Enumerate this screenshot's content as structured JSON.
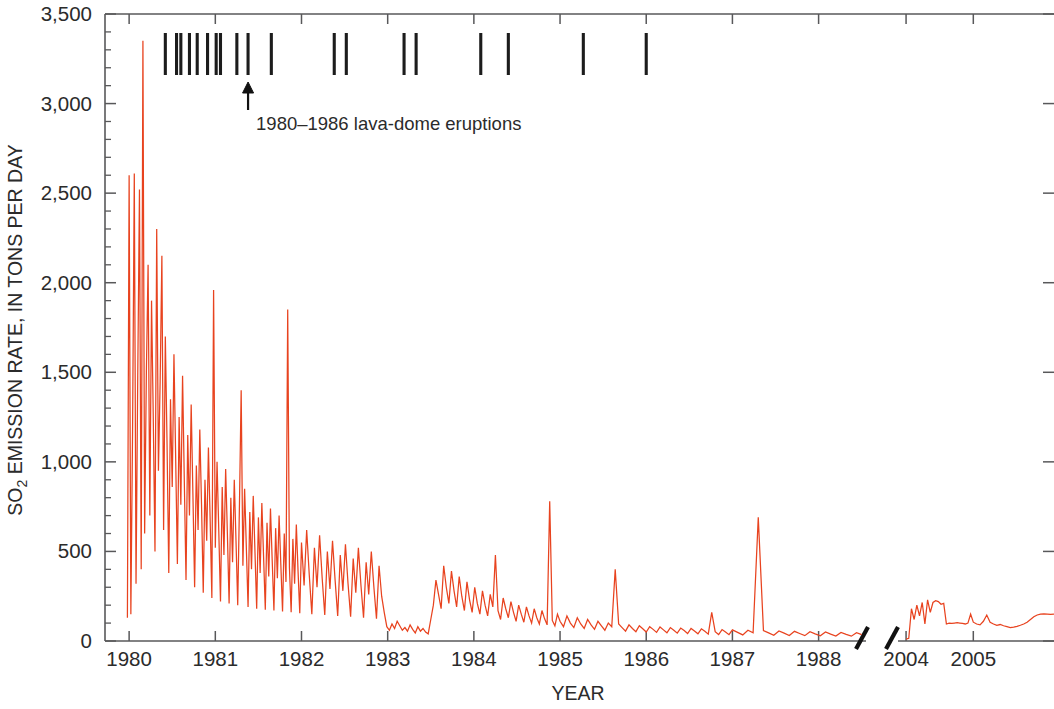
{
  "chart_data": {
    "type": "line",
    "title": "",
    "xlabel": "YEAR",
    "ylabel": "SO2 EMISSION RATE, IN TONS PER DAY",
    "ylabel_main": "SO",
    "ylabel_sub": "2",
    "ylabel_rest": " EMISSION RATE, IN TONS PER DAY",
    "ylim": [
      0,
      3500
    ],
    "ytick_values": [
      0,
      500,
      1000,
      1500,
      2000,
      2500,
      3000,
      3500
    ],
    "ytick_labels": [
      "0",
      "500",
      "1,000",
      "1,500",
      "2,000",
      "2,500",
      "3,000",
      "3,500"
    ],
    "yminor_step": 100,
    "grid": false,
    "legend_position": "none",
    "line_color": "#e8431f",
    "axis_color": "#58585a",
    "event_color": "#1c1c1c",
    "axis_break": true,
    "axis_break_note": "time axis broken between 1988.5 and 2004.0",
    "segments": [
      {
        "name": "1980-1988",
        "xtick_values": [
          1980,
          1981,
          1982,
          1983,
          1984,
          1985,
          1986,
          1987,
          1988
        ],
        "xtick_labels": [
          "1980",
          "1981",
          "1982",
          "1983",
          "1984",
          "1985",
          "1986",
          "1987",
          "1988"
        ],
        "xlim": [
          1979.72,
          1988.55
        ],
        "x": [
          1979.98,
          1980.0,
          1980.02,
          1980.04,
          1980.06,
          1980.08,
          1980.1,
          1980.12,
          1980.14,
          1980.16,
          1980.18,
          1980.2,
          1980.22,
          1980.24,
          1980.26,
          1980.28,
          1980.3,
          1980.32,
          1980.34,
          1980.36,
          1980.38,
          1980.4,
          1980.42,
          1980.44,
          1980.46,
          1980.48,
          1980.5,
          1980.52,
          1980.54,
          1980.56,
          1980.58,
          1980.6,
          1980.62,
          1980.64,
          1980.66,
          1980.68,
          1980.7,
          1980.72,
          1980.74,
          1980.76,
          1980.78,
          1980.8,
          1980.82,
          1980.84,
          1980.86,
          1980.88,
          1980.9,
          1980.92,
          1980.94,
          1980.96,
          1980.98,
          1981.0,
          1981.02,
          1981.04,
          1981.06,
          1981.08,
          1981.1,
          1981.12,
          1981.14,
          1981.16,
          1981.18,
          1981.2,
          1981.22,
          1981.24,
          1981.26,
          1981.28,
          1981.3,
          1981.32,
          1981.34,
          1981.36,
          1981.38,
          1981.4,
          1981.42,
          1981.44,
          1981.46,
          1981.48,
          1981.5,
          1981.52,
          1981.54,
          1981.56,
          1981.58,
          1981.6,
          1981.62,
          1981.64,
          1981.66,
          1981.68,
          1981.7,
          1981.72,
          1981.74,
          1981.76,
          1981.78,
          1981.8,
          1981.82,
          1981.84,
          1981.86,
          1981.88,
          1981.9,
          1981.92,
          1981.94,
          1981.96,
          1981.98,
          1982.0,
          1982.03,
          1982.06,
          1982.09,
          1982.12,
          1982.15,
          1982.18,
          1982.21,
          1982.24,
          1982.27,
          1982.3,
          1982.33,
          1982.36,
          1982.39,
          1982.42,
          1982.45,
          1982.48,
          1982.51,
          1982.54,
          1982.57,
          1982.6,
          1982.63,
          1982.66,
          1982.69,
          1982.72,
          1982.75,
          1982.78,
          1982.81,
          1982.84,
          1982.87,
          1982.9,
          1982.93,
          1982.96,
          1982.99,
          1983.02,
          1983.05,
          1983.08,
          1983.11,
          1983.14,
          1983.17,
          1983.2,
          1983.23,
          1983.26,
          1983.29,
          1983.32,
          1983.35,
          1983.38,
          1983.41,
          1983.44,
          1983.47,
          1983.5,
          1983.53,
          1983.56,
          1983.59,
          1983.62,
          1983.65,
          1983.68,
          1983.71,
          1983.74,
          1983.77,
          1983.8,
          1983.83,
          1983.86,
          1983.89,
          1983.92,
          1983.95,
          1983.98,
          1984.01,
          1984.04,
          1984.07,
          1984.1,
          1984.13,
          1984.16,
          1984.19,
          1984.22,
          1984.25,
          1984.28,
          1984.31,
          1984.34,
          1984.37,
          1984.4,
          1984.43,
          1984.46,
          1984.49,
          1984.52,
          1984.55,
          1984.58,
          1984.61,
          1984.64,
          1984.67,
          1984.7,
          1984.73,
          1984.76,
          1984.79,
          1984.82,
          1984.85,
          1984.88,
          1984.91,
          1984.94,
          1984.97,
          1985.0,
          1985.04,
          1985.08,
          1985.12,
          1985.16,
          1985.2,
          1985.24,
          1985.28,
          1985.32,
          1985.36,
          1985.4,
          1985.44,
          1985.48,
          1985.52,
          1985.56,
          1985.6,
          1985.64,
          1985.68,
          1985.72,
          1985.76,
          1985.8,
          1985.84,
          1985.88,
          1985.92,
          1985.96,
          1986.0,
          1986.04,
          1986.08,
          1986.12,
          1986.16,
          1986.2,
          1986.24,
          1986.28,
          1986.32,
          1986.36,
          1986.4,
          1986.44,
          1986.48,
          1986.52,
          1986.56,
          1986.6,
          1986.64,
          1986.68,
          1986.72,
          1986.76,
          1986.8,
          1986.84,
          1986.88,
          1986.92,
          1986.96,
          1987.0,
          1987.06,
          1987.12,
          1987.18,
          1987.24,
          1987.3,
          1987.36,
          1987.42,
          1987.48,
          1987.54,
          1987.6,
          1987.66,
          1987.72,
          1987.78,
          1987.84,
          1987.9,
          1987.96,
          1988.02,
          1988.08,
          1988.14,
          1988.2,
          1988.26,
          1988.32,
          1988.38,
          1988.44,
          1988.5
        ],
        "y": [
          130,
          2600,
          150,
          1180,
          2610,
          320,
          1480,
          2520,
          400,
          3350,
          600,
          1500,
          2100,
          700,
          1900,
          1250,
          500,
          2300,
          950,
          1450,
          2150,
          620,
          1700,
          1100,
          380,
          1350,
          860,
          1600,
          1020,
          430,
          1250,
          760,
          1480,
          900,
          340,
          1150,
          700,
          1320,
          820,
          300,
          980,
          620,
          1180,
          760,
          270,
          900,
          560,
          1080,
          680,
          240,
          1960,
          520,
          1000,
          620,
          220,
          860,
          480,
          960,
          600,
          210,
          800,
          440,
          900,
          560,
          200,
          760,
          1400,
          420,
          850,
          520,
          190,
          720,
          400,
          810,
          500,
          180,
          690,
          380,
          770,
          470,
          175,
          660,
          360,
          740,
          450,
          170,
          630,
          350,
          700,
          430,
          165,
          600,
          330,
          1850,
          410,
          160,
          570,
          320,
          650,
          390,
          155,
          550,
          310,
          620,
          370,
          150,
          520,
          300,
          590,
          350,
          145,
          500,
          290,
          560,
          340,
          140,
          480,
          280,
          540,
          320,
          135,
          460,
          270,
          520,
          310,
          130,
          440,
          260,
          500,
          300,
          125,
          420,
          250,
          160,
          80,
          60,
          95,
          70,
          110,
          85,
          60,
          75,
          55,
          90,
          65,
          45,
          80,
          55,
          70,
          50,
          40,
          120,
          200,
          340,
          260,
          180,
          420,
          300,
          210,
          390,
          280,
          190,
          360,
          250,
          170,
          330,
          230,
          160,
          300,
          210,
          150,
          280,
          200,
          140,
          260,
          190,
          480,
          170,
          120,
          240,
          180,
          130,
          220,
          160,
          110,
          200,
          150,
          105,
          190,
          140,
          100,
          180,
          130,
          95,
          170,
          125,
          90,
          780,
          115,
          85,
          150,
          110,
          80,
          140,
          100,
          75,
          130,
          95,
          70,
          120,
          90,
          65,
          110,
          85,
          60,
          100,
          80,
          400,
          95,
          75,
          55,
          90,
          70,
          52,
          85,
          68,
          50,
          80,
          65,
          48,
          78,
          62,
          46,
          75,
          60,
          44,
          72,
          58,
          42,
          70,
          56,
          40,
          68,
          54,
          38,
          160,
          52,
          36,
          64,
          50,
          35,
          62,
          48,
          34,
          60,
          46,
          690,
          58,
          45,
          32,
          56,
          44,
          31,
          54,
          42,
          30,
          52,
          40,
          29,
          50,
          38,
          28,
          48,
          37,
          27,
          46,
          36,
          26,
          45,
          35,
          670,
          44,
          34,
          25,
          43,
          33,
          24,
          42,
          32,
          23,
          41,
          31,
          22,
          40,
          30,
          21,
          39,
          29,
          20,
          38,
          28,
          19,
          37,
          27,
          18,
          36,
          26,
          30,
          25,
          35,
          28,
          22,
          32,
          26,
          20,
          30,
          24,
          18,
          28,
          22,
          17,
          26,
          21,
          16,
          25,
          20,
          15,
          24,
          19,
          14,
          23,
          18,
          13,
          22,
          17
        ]
      },
      {
        "name": "2004-2006",
        "xtick_values": [
          2004,
          2005
        ],
        "xtick_labels": [
          "2004",
          "2005"
        ],
        "xlim": [
          2003.88,
          2006.2
        ],
        "x": [
          2004.0,
          2004.04,
          2004.08,
          2004.12,
          2004.16,
          2004.2,
          2004.24,
          2004.28,
          2004.32,
          2004.36,
          2004.4,
          2004.44,
          2004.48,
          2004.52,
          2004.56,
          2004.6,
          2004.64,
          2004.68,
          2004.72,
          2004.76,
          2004.8,
          2004.84,
          2004.88,
          2004.92,
          2004.96,
          2005.0,
          2005.05,
          2005.1,
          2005.15,
          2005.2,
          2005.25,
          2005.3,
          2005.35,
          2005.4,
          2005.45,
          2005.5,
          2005.55,
          2005.6,
          2005.65,
          2005.7,
          2005.75,
          2005.8,
          2005.85,
          2005.9,
          2005.95,
          2006.0,
          2006.05,
          2006.1,
          2006.15,
          2006.2
        ],
        "y": [
          10,
          15,
          180,
          120,
          200,
          140,
          215,
          95,
          230,
          160,
          215,
          225,
          220,
          205,
          210,
          95,
          100,
          98,
          100,
          102,
          100,
          98,
          95,
          100,
          150,
          105,
          95,
          90,
          110,
          145,
          105,
          95,
          88,
          92,
          85,
          80,
          75,
          78,
          82,
          88,
          95,
          105,
          120,
          135,
          145,
          150,
          152,
          150,
          148,
          150
        ]
      }
    ],
    "events": {
      "label": "1980–1986 lava-dome eruptions",
      "arrow_at_event_index": 9,
      "dates": [
        1980.42,
        1980.55,
        1980.6,
        1980.7,
        1980.79,
        1980.91,
        1981.01,
        1981.06,
        1981.25,
        1981.38,
        1981.65,
        1982.38,
        1982.52,
        1983.19,
        1983.33,
        1984.08,
        1984.4,
        1985.27,
        1986.0
      ]
    }
  }
}
